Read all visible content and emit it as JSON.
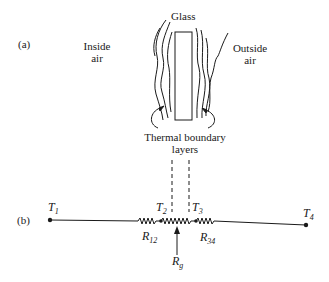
{
  "part_a": {
    "label": "(a)",
    "glass": "Glass",
    "inside_air_line1": "Inside",
    "inside_air_line2": "air",
    "outside_air_line1": "Outside",
    "outside_air_line2": "air",
    "boundary_line1": "Thermal boundary",
    "boundary_line2": "layers"
  },
  "part_b": {
    "label": "(b)",
    "nodes": [
      {
        "name": "T",
        "sub": "1"
      },
      {
        "name": "T",
        "sub": "2"
      },
      {
        "name": "T",
        "sub": "3"
      },
      {
        "name": "T",
        "sub": "4"
      }
    ],
    "resistors": [
      {
        "name": "R",
        "sub": "12"
      },
      {
        "name": "R",
        "sub": "g"
      },
      {
        "name": "R",
        "sub": "34"
      }
    ]
  },
  "colors": {
    "ink": "#1a1a1a",
    "background": "#ffffff"
  }
}
